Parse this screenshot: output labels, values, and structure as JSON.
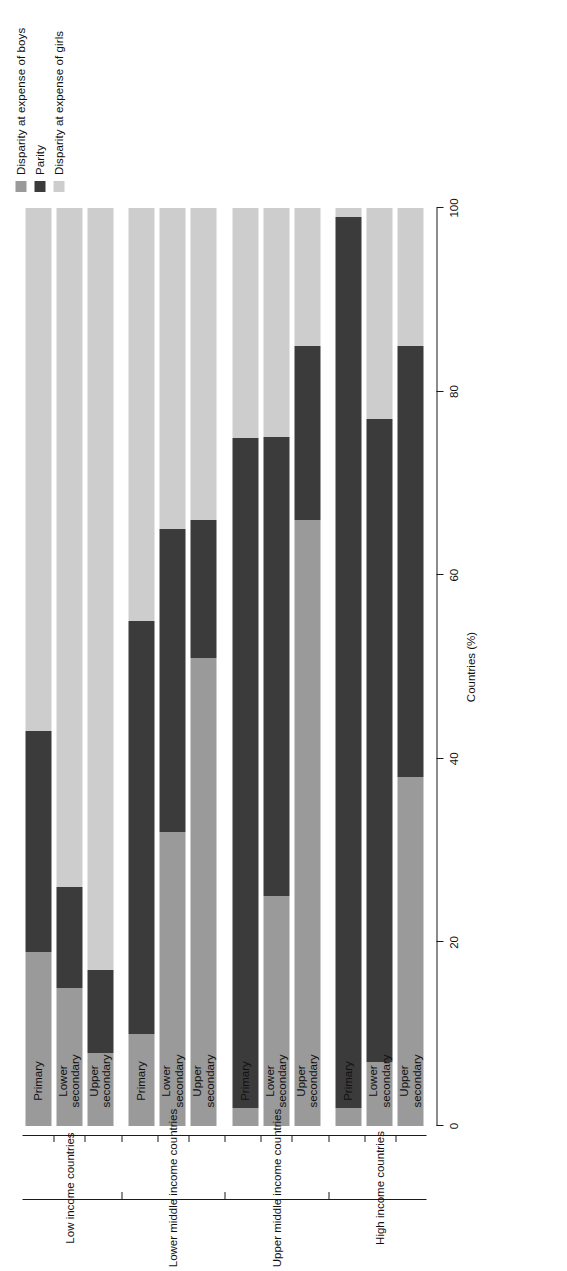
{
  "chart_data": {
    "type": "bar",
    "orientation": "stacked-horizontal",
    "title": "",
    "xlabel": "",
    "ylabel": "Countries (%)",
    "ylim": [
      0,
      100
    ],
    "yticks": [
      0,
      20,
      40,
      60,
      80,
      100
    ],
    "grid": false,
    "legend_position": "top-right",
    "stacked": true,
    "categories": [
      "Primary",
      "Lower secondary",
      "Upper secondary",
      "Primary",
      "Lower secondary",
      "Upper secondary",
      "Primary",
      "Lower secondary",
      "Upper secondary",
      "Primary",
      "Lower secondary",
      "Upper secondary"
    ],
    "groups": [
      {
        "label": "Low income countries",
        "categories": [
          "Primary",
          "Lower secondary",
          "Upper secondary"
        ]
      },
      {
        "label": "Lower middle income countries",
        "categories": [
          "Primary",
          "Lower secondary",
          "Upper secondary"
        ]
      },
      {
        "label": "Upper middle income countries",
        "categories": [
          "Primary",
          "Lower secondary",
          "Upper secondary"
        ]
      },
      {
        "label": "High income countries",
        "categories": [
          "Primary",
          "Lower secondary",
          "Upper secondary"
        ]
      }
    ],
    "series": [
      {
        "name": "Disparity at expense of girls",
        "color": "#cdcdcd",
        "values": [
          57,
          74,
          83,
          45,
          35,
          34,
          25,
          25,
          15,
          1,
          23,
          15
        ]
      },
      {
        "name": "Parity",
        "color": "#3b3b3b",
        "values": [
          24,
          11,
          9,
          45,
          33,
          15,
          73,
          50,
          19,
          97,
          70,
          47
        ]
      },
      {
        "name": "Disparity at expense of boys",
        "color": "#9a9a9a",
        "values": [
          19,
          15,
          8,
          10,
          32,
          51,
          2,
          25,
          66,
          2,
          7,
          38
        ]
      }
    ],
    "bars": [
      {
        "group": "Low income countries",
        "level": "Primary",
        "girls": 57,
        "parity": 24,
        "boys": 19
      },
      {
        "group": "Low income countries",
        "level": "Lower secondary",
        "girls": 74,
        "parity": 11,
        "boys": 15
      },
      {
        "group": "Low income countries",
        "level": "Upper secondary",
        "girls": 83,
        "parity": 9,
        "boys": 8
      },
      {
        "group": "Lower middle income countries",
        "level": "Primary",
        "girls": 45,
        "parity": 45,
        "boys": 10
      },
      {
        "group": "Lower middle income countries",
        "level": "Lower secondary",
        "girls": 35,
        "parity": 33,
        "boys": 32
      },
      {
        "group": "Lower middle income countries",
        "level": "Upper secondary",
        "girls": 34,
        "parity": 15,
        "boys": 51
      },
      {
        "group": "Upper middle income countries",
        "level": "Primary",
        "girls": 25,
        "parity": 73,
        "boys": 2
      },
      {
        "group": "Upper middle income countries",
        "level": "Lower secondary",
        "girls": 25,
        "parity": 50,
        "boys": 25
      },
      {
        "group": "Upper middle income countries",
        "level": "Upper secondary",
        "girls": 15,
        "parity": 19,
        "boys": 66
      },
      {
        "group": "High income countries",
        "level": "Primary",
        "girls": 1,
        "parity": 97,
        "boys": 2
      },
      {
        "group": "High income countries",
        "level": "Lower secondary",
        "girls": 23,
        "parity": 70,
        "boys": 7
      },
      {
        "group": "High income countries",
        "level": "Upper secondary",
        "girls": 15,
        "parity": 47,
        "boys": 38
      }
    ]
  },
  "legend": {
    "items": [
      {
        "label": "Disparity at expense of boys",
        "color": "#9a9a9a",
        "swatch": "legend-swatch-boys"
      },
      {
        "label": "Parity",
        "color": "#3b3b3b",
        "swatch": "legend-swatch-parity"
      },
      {
        "label": "Disparity at expense of girls",
        "color": "#cdcdcd",
        "swatch": "legend-swatch-girls"
      }
    ]
  },
  "axes": {
    "value_axis_title": "Countries (%)",
    "value_ticks": [
      "0",
      "20",
      "40",
      "60",
      "80",
      "100"
    ]
  }
}
